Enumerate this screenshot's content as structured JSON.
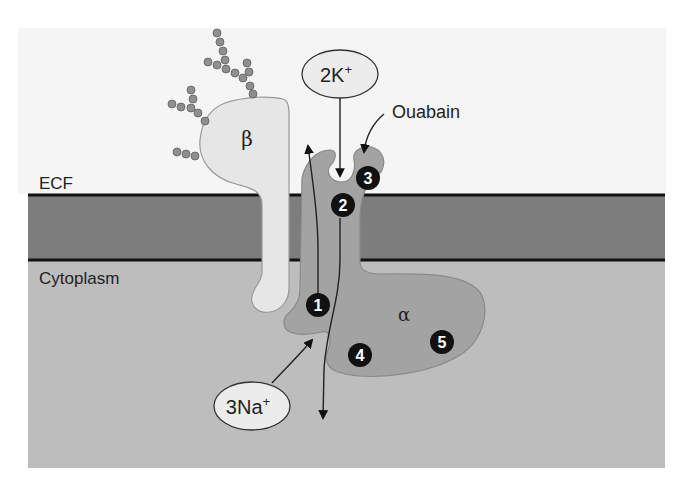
{
  "figure": {
    "regions": {
      "ecf_label": "ECF",
      "cytoplasm_label": "Cytoplasm"
    },
    "subunits": {
      "beta_label": "β",
      "alpha_label": "α"
    },
    "ions": {
      "potassium_label_main": "2K",
      "potassium_label_sup": "+",
      "sodium_label_main": "3Na",
      "sodium_label_sup": "+"
    },
    "inhibitor": {
      "label": "Ouabain"
    },
    "steps": [
      "1",
      "2",
      "3",
      "4",
      "5"
    ],
    "colors": {
      "background": "#ffffff",
      "ecf_band": "#f4f4f4",
      "membrane": "#7d7d7d",
      "membrane_line": "#111111",
      "cytoplasm": "#bdbdbd",
      "alpha_subunit": "#a3a3a3",
      "beta_subunit": "#e6e6e6",
      "ion_bubble": "#ececec",
      "step_badge": "#111111",
      "glycan_bead": "#8f8f8f"
    }
  }
}
